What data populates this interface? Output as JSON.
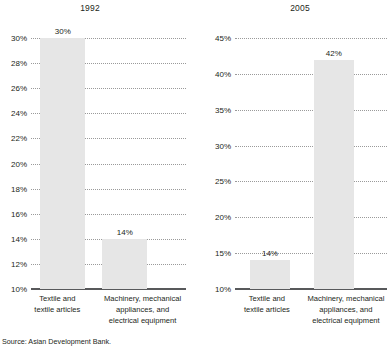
{
  "source_note": "Source: Asian Development Bank.",
  "chart_data": [
    {
      "type": "bar",
      "title": "1992",
      "xlabel": "",
      "ylabel": "",
      "ylim": [
        10,
        30
      ],
      "ytick_step": 2,
      "ytick_labels": [
        "30%",
        "28%",
        "26%",
        "24%",
        "22%",
        "20%",
        "18%",
        "16%",
        "14%",
        "12%",
        "10%"
      ],
      "ytick_values": [
        30,
        28,
        26,
        24,
        22,
        20,
        18,
        16,
        14,
        12,
        10
      ],
      "grid": true,
      "legend": "none",
      "categories": [
        "Textile and textile articles",
        "Machinery, mechanical appliances, and electrical equipment"
      ],
      "category_lines": [
        [
          "Textile and",
          "textile articles"
        ],
        [
          "Machinery, mechanical",
          "appliances, and",
          "electrical equipment"
        ]
      ],
      "values": [
        30,
        14
      ],
      "value_labels": [
        "30%",
        "14%"
      ],
      "bar_color": "#e6e6e6"
    },
    {
      "type": "bar",
      "title": "2005",
      "xlabel": "",
      "ylabel": "",
      "ylim": [
        10,
        45
      ],
      "ytick_step": 5,
      "ytick_labels": [
        "45%",
        "40%",
        "35%",
        "30%",
        "25%",
        "20%",
        "15%",
        "10%"
      ],
      "ytick_values": [
        45,
        40,
        35,
        30,
        25,
        20,
        15,
        10
      ],
      "grid": true,
      "legend": "none",
      "categories": [
        "Textile and textile articles",
        "Machinery, mechanical appliances, and electrical equipment"
      ],
      "category_lines": [
        [
          "Textile and",
          "textile articles"
        ],
        [
          "Machinery, mechanical",
          "appliances, and",
          "electrical equipment"
        ]
      ],
      "values": [
        14,
        42
      ],
      "value_labels": [
        "14%",
        "42%"
      ],
      "bar_color": "#e6e6e6"
    }
  ]
}
